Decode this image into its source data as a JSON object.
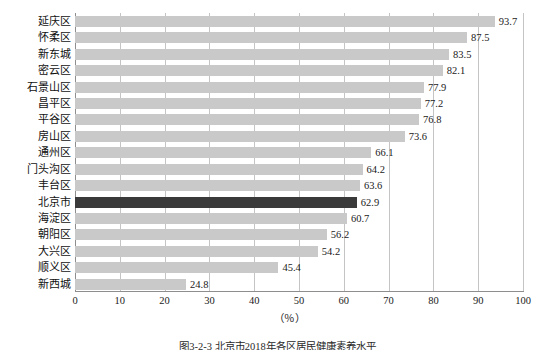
{
  "chart_data": {
    "type": "bar",
    "orientation": "horizontal",
    "title": "",
    "xlabel": "（％）",
    "ylabel": "",
    "xlim": [
      0,
      100
    ],
    "xticks": [
      0,
      10,
      20,
      30,
      40,
      50,
      60,
      70,
      80,
      90,
      100
    ],
    "grid": "vertical",
    "legend": "none",
    "categories": [
      "延庆区",
      "怀柔区",
      "新东城",
      "密云区",
      "石景山区",
      "昌平区",
      "平谷区",
      "房山区",
      "通州区",
      "门头沟区",
      "丰台区",
      "北京市",
      "海淀区",
      "朝阳区",
      "大兴区",
      "顺义区",
      "新西城"
    ],
    "values": [
      93.7,
      87.5,
      83.5,
      82.1,
      77.9,
      77.2,
      76.8,
      73.6,
      66.1,
      64.2,
      63.6,
      62.9,
      60.7,
      56.2,
      54.2,
      45.4,
      24.8
    ],
    "highlight_category": "北京市",
    "highlight_index": 11,
    "colors": {
      "bar": "#c9c9c9",
      "bar_highlight": "#3a3a3a",
      "gridline": "#c4c4c4",
      "axis": "#8e8e8e",
      "text": "#1a1a1a"
    }
  },
  "caption": "图3-2-3 北京市2018年各区居民健康素养水平"
}
